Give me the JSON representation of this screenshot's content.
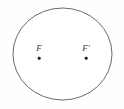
{
  "figure": {
    "background_color": "#fefefe",
    "stroke_color": "#6b6b6b",
    "stroke_width": 1,
    "fill_color": "#ffffff",
    "label_color": "#3a3a3a",
    "dot_color": "#1c1c1c",
    "ellipse": {
      "center_x": 62.5,
      "center_y": 54,
      "radius_x": 49.5,
      "radius_y": 46
    },
    "foci": [
      {
        "name": "focus-left",
        "label": "F",
        "x": 39,
        "y": 58
      },
      {
        "name": "focus-right",
        "label": "F′",
        "x": 86,
        "y": 58
      }
    ]
  }
}
